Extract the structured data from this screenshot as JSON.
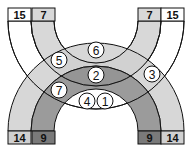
{
  "diagram": {
    "colors": {
      "white": "#ffffff",
      "light": "#d8d8d8",
      "mid": "#b4b4b4",
      "dark": "#8a8a8a",
      "darker": "#6e6e6e",
      "stroke": "#111111"
    },
    "labels": {
      "top_left_outer": "15",
      "top_left_inner": "7",
      "top_right_inner": "7",
      "top_right_outer": "15",
      "bottom_left_outer": "14",
      "bottom_left_inner": "9",
      "bottom_right_inner": "9",
      "bottom_right_outer": "14"
    },
    "regions": {
      "r1": "1",
      "r2": "2",
      "r3": "3",
      "r4": "4",
      "r5": "5",
      "r6": "6",
      "r7": "7"
    }
  }
}
